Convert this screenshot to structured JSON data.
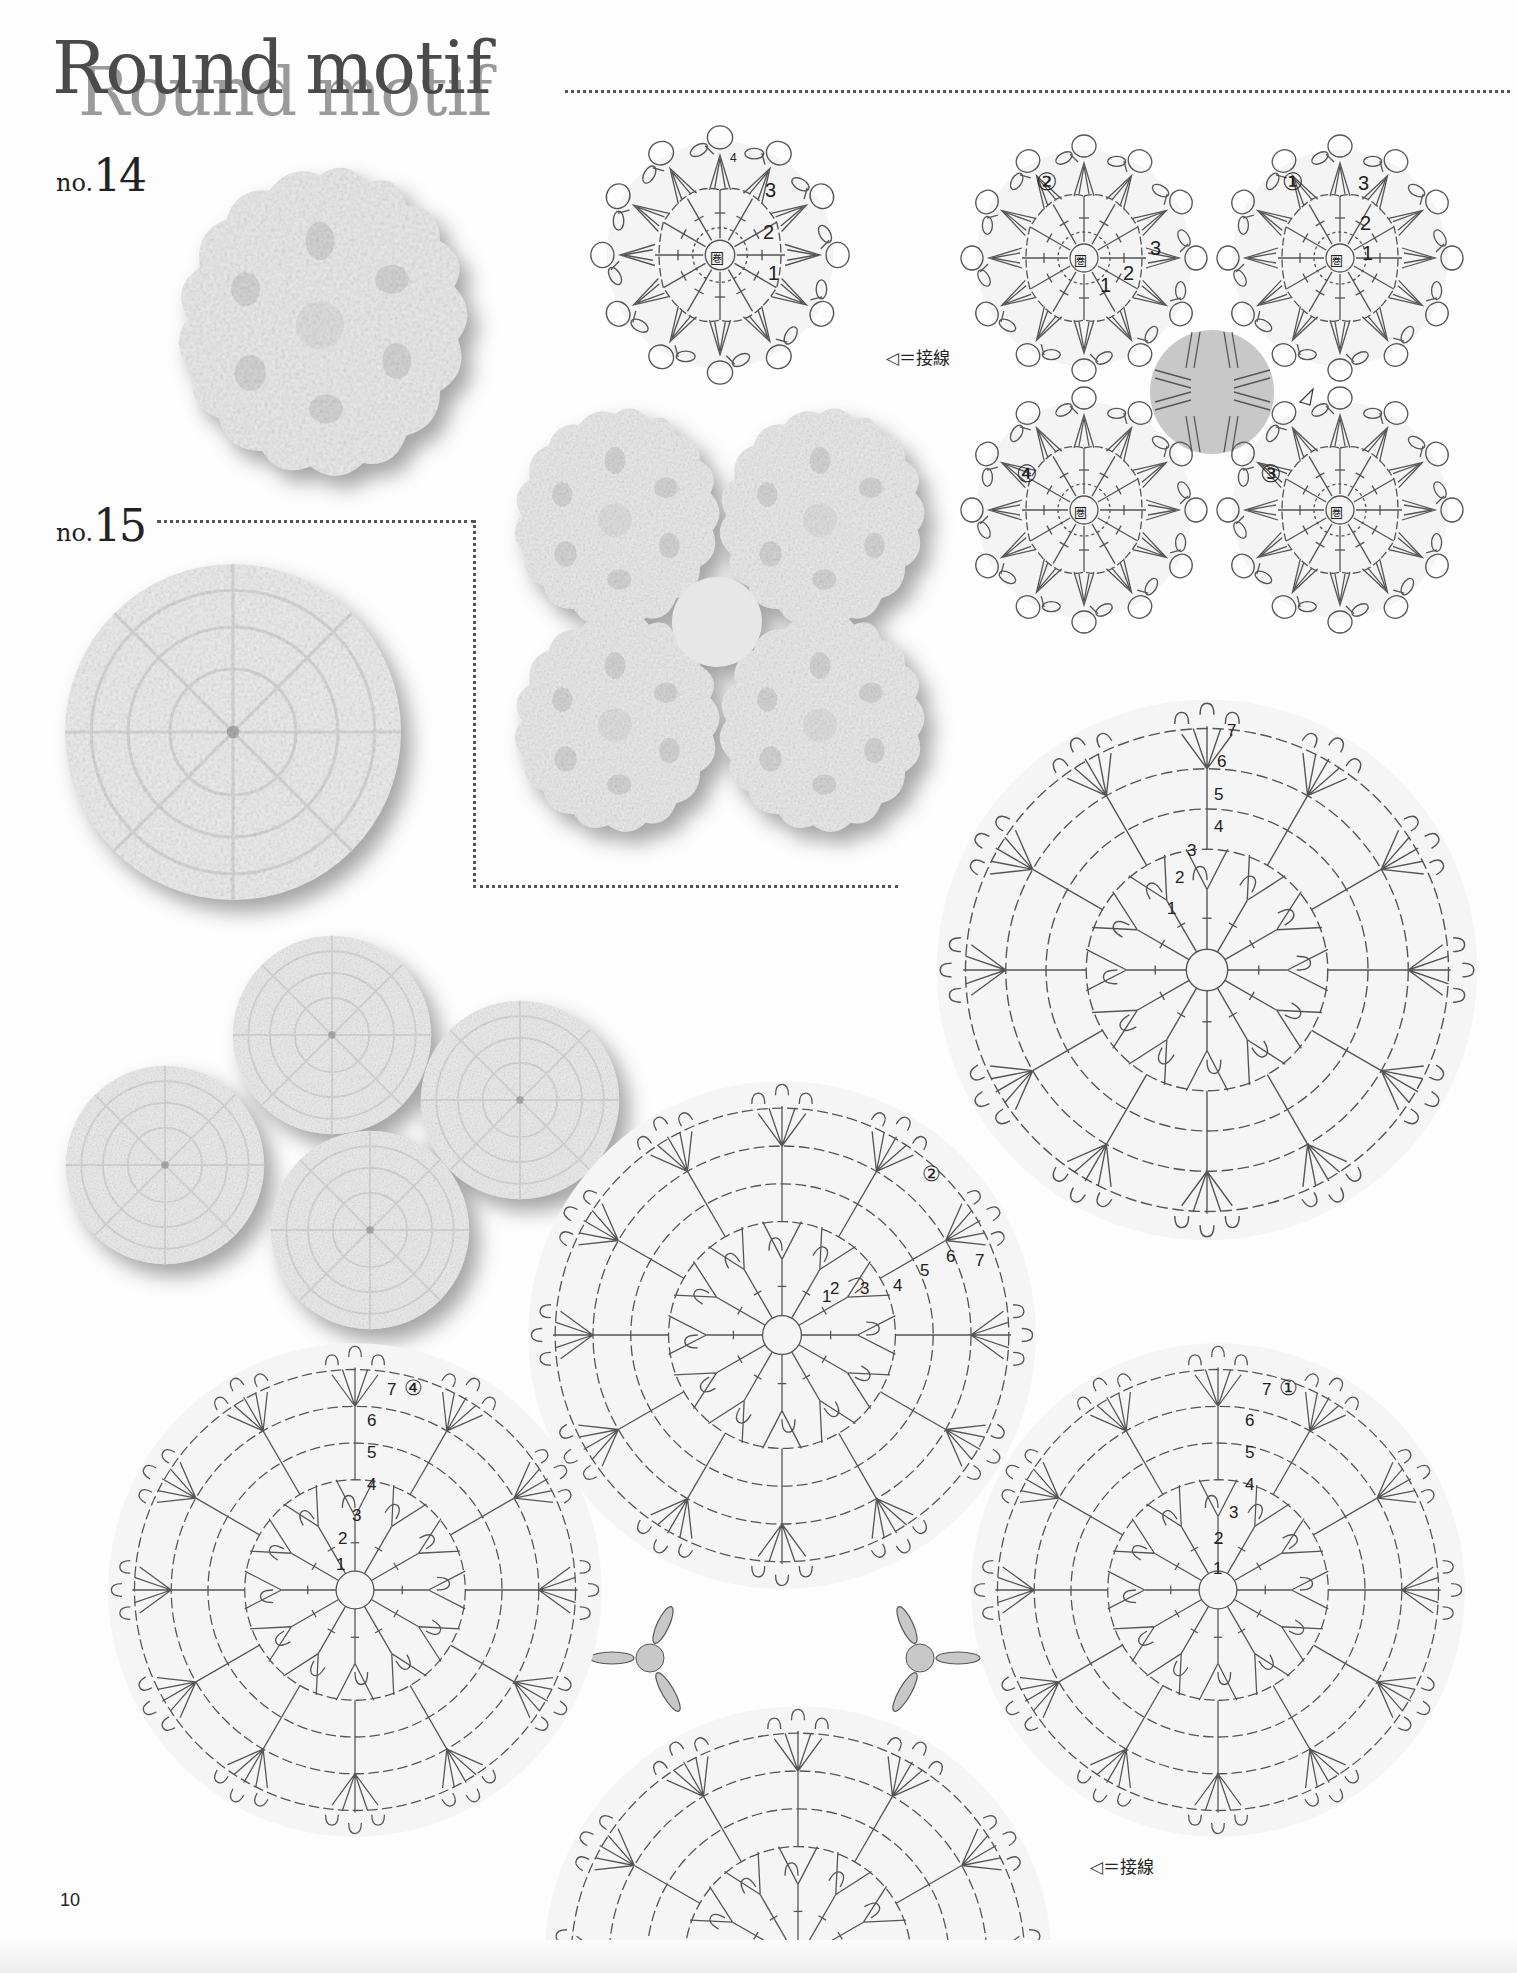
{
  "header": {
    "title": "Round motif"
  },
  "page_number": "10",
  "motifs": [
    {
      "id": "no14",
      "prefix": "no.",
      "number": "14",
      "photos": [
        "single motif photo",
        "four joined motifs photo"
      ],
      "single_chart": {
        "center_label": "圏",
        "round_labels": [
          "1",
          "2",
          "3",
          "4"
        ]
      },
      "joined_chart": {
        "motif_labels": [
          "①",
          "②",
          "③",
          "④"
        ],
        "center_label": "圏",
        "round_labels": [
          "1",
          "2",
          "3",
          "4"
        ]
      },
      "legend": {
        "symbol": "◁",
        "text": "＝接線"
      }
    },
    {
      "id": "no15",
      "prefix": "no.",
      "number": "15",
      "photos": [
        "single motif photo",
        "four joined motifs photo"
      ],
      "single_chart": {
        "round_labels": [
          "1",
          "2",
          "3",
          "4",
          "5",
          "6",
          "7"
        ]
      },
      "joined_chart": {
        "motif_labels": [
          "①",
          "②",
          "③",
          "④"
        ],
        "round_labels": [
          "1",
          "2",
          "3",
          "4",
          "5",
          "6",
          "7"
        ]
      },
      "legend": {
        "symbol": "◁",
        "text": "＝接線"
      }
    }
  ],
  "colors": {
    "text": "#222222",
    "title": "#4a4a4a",
    "title_shadow": "#9a9a9a",
    "diagram_line": "#555555",
    "join_fill": "#c8c8c8",
    "paper": "#fdfdfd"
  }
}
